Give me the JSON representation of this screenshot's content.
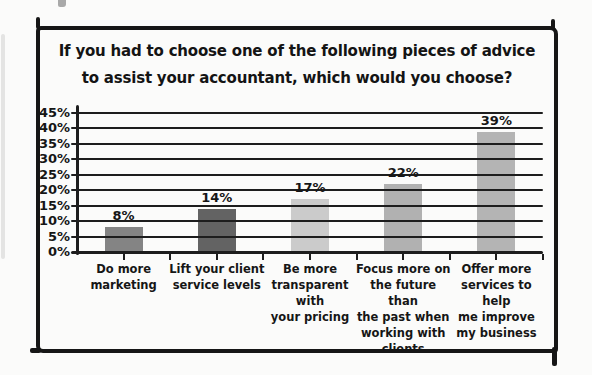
{
  "title": {
    "line1": "If you had to choose one of the following pieces of advice",
    "line2": "to assist your accountant, which would you choose?"
  },
  "chart_data": {
    "type": "bar",
    "title": "If you had to choose one of the following pieces of advice to assist your accountant, which would you choose?",
    "categories": [
      "Do more marketing",
      "Lift your client service levels",
      "Be more transparent with your pricing",
      "Focus more on the future than the past when working with clients",
      "Offer more services to help me improve my business"
    ],
    "category_label_lines": [
      [
        "Do more",
        "marketing"
      ],
      [
        "Lift your client",
        "service levels"
      ],
      [
        "Be more",
        "transparent with",
        "your pricing"
      ],
      [
        "Focus more on",
        "the future than",
        "the past when",
        "working with",
        "clients"
      ],
      [
        "Offer more",
        "services to help",
        "me improve",
        "my business"
      ]
    ],
    "values": [
      8,
      14,
      17,
      22,
      39
    ],
    "value_labels": [
      "8%",
      "14%",
      "17%",
      "22%",
      "39%"
    ],
    "bar_colors": [
      "#848484",
      "#636363",
      "#cbcbcb",
      "#b1b1b1",
      "#b4b4b4"
    ],
    "ylim": [
      0,
      45
    ],
    "ytick_step": 5,
    "ytick_labels": [
      "0%",
      "5%",
      "10%",
      "15%",
      "20%",
      "25%",
      "30%",
      "35%",
      "40%",
      "45%"
    ],
    "xlabel": "",
    "ylabel": "",
    "grid": "horizontal, drawn over bars",
    "legend": "none",
    "style": "hand-drawn sketch, grayscale bars, black frame"
  },
  "colors": {
    "frame": "#161616",
    "grid": "#1d1d1d",
    "text": "#141414",
    "background": "#fbfbfa"
  }
}
